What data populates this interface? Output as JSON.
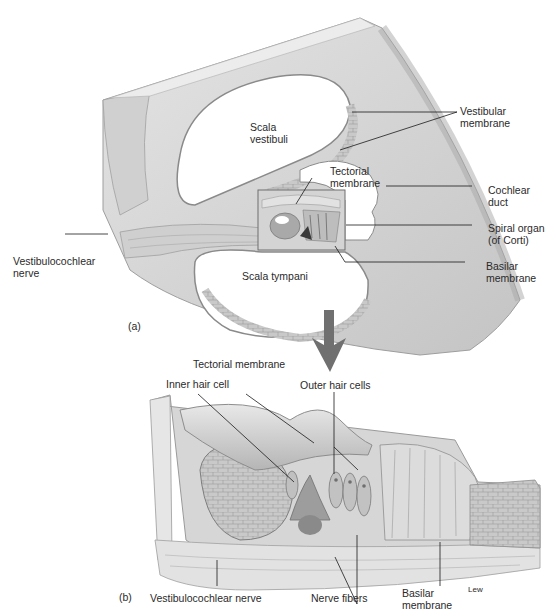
{
  "figure": {
    "panel_a": {
      "panel_label": "(a)",
      "regions": {
        "scala_vestibuli": [
          "Scala",
          "vestibuli"
        ],
        "scala_tympani": "Scala tympani"
      },
      "labels": {
        "vestibular_membrane": [
          "Vestibular",
          "membrane"
        ],
        "tectorial_membrane": [
          "Tectorial",
          "membrane"
        ],
        "cochlear_duct": [
          "Cochlear",
          "duct"
        ],
        "spiral_organ": [
          "Spiral organ",
          "(of Corti)"
        ],
        "basilar_membrane": [
          "Basilar",
          "membrane"
        ],
        "vestibulocochlear_nerve": [
          "Vestibulocochlear",
          "nerve"
        ]
      }
    },
    "panel_b": {
      "panel_label": "(b)",
      "labels": {
        "tectorial_membrane": "Tectorial membrane",
        "inner_hair_cell": "Inner hair cell",
        "outer_hair_cells": "Outer hair cells",
        "vestibulocochlear_nerve": "Vestibulocochlear nerve",
        "nerve_fibers": "Nerve fibers",
        "basilar_membrane": [
          "Basilar",
          "membrane"
        ]
      },
      "artist_signature": "Lew"
    },
    "colors": {
      "tissue_light": "#d9d9d9",
      "tissue_mid": "#b8b8b8",
      "tissue_dark": "#8a8a8a",
      "arrow": "#6e6e6e",
      "leader_line": "#1a1a1a"
    }
  }
}
